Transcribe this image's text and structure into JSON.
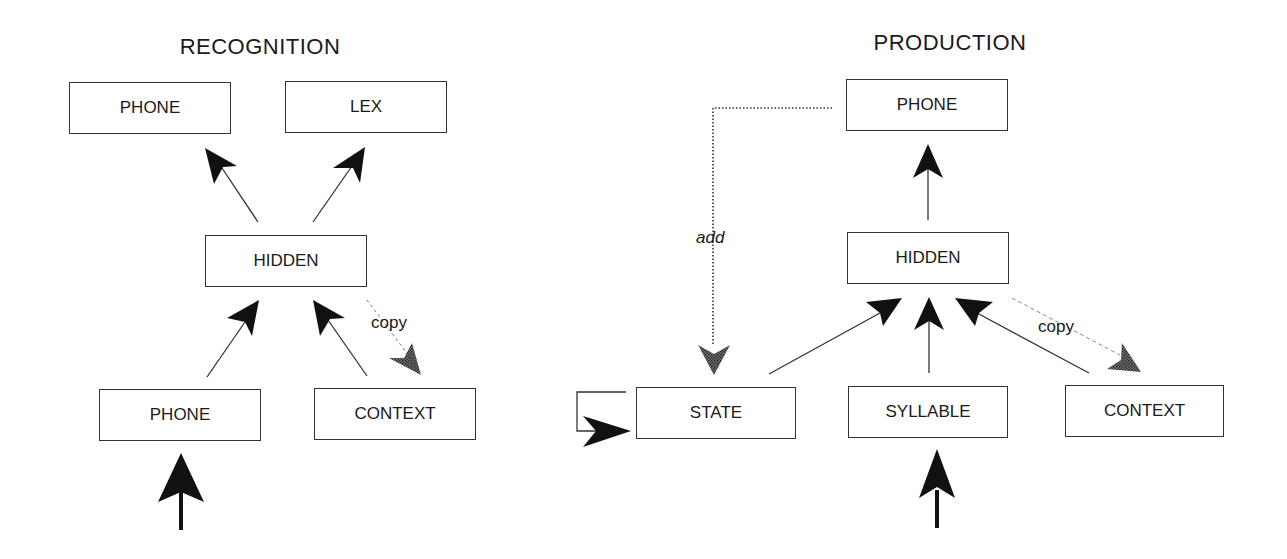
{
  "recognition": {
    "title": "RECOGNITION",
    "nodes": {
      "phone_out": "PHONE",
      "lex": "LEX",
      "hidden": "HIDDEN",
      "phone_in": "PHONE",
      "context": "CONTEXT"
    },
    "copy_label": "copy"
  },
  "production": {
    "title": "PRODUCTION",
    "nodes": {
      "phone_out": "PHONE",
      "hidden": "HIDDEN",
      "state": "STATE",
      "syllable": "SYLLABLE",
      "context": "CONTEXT"
    },
    "copy_label": "copy",
    "add_label": "add"
  },
  "colors": {
    "line": "#333333",
    "arrowhead": "#111111",
    "copy_arrow": "#555555"
  }
}
